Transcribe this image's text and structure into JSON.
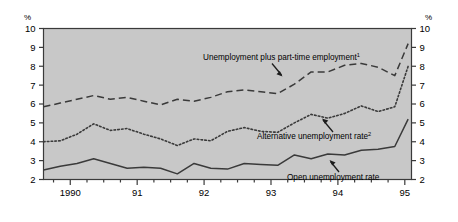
{
  "axis": {
    "unit_left": "%",
    "unit_right": "%",
    "y_ticks": [
      "10",
      "9",
      "8",
      "7",
      "6",
      "5",
      "4",
      "3",
      "2"
    ],
    "y_ticks_right": [
      "10",
      "9",
      "8",
      "7",
      "6",
      "5",
      "4",
      "3",
      "2"
    ],
    "x_labels": [
      "1990",
      "91",
      "92",
      "93",
      "94",
      "95"
    ]
  },
  "annotations": {
    "series1_label": "Unemployment plus part-time employment",
    "series1_sup": "1",
    "series2_label": "Alternative unemployment rate",
    "series2_sup": "2",
    "series3_label": "Open unemployment rate"
  },
  "colors": {
    "plot_background": "#c8c8c8",
    "plot_border": "#3a3a3a",
    "line": "#3a3a3a",
    "text": "#000000",
    "page_background": "#ffffff"
  },
  "chart_data": {
    "type": "line",
    "title": "",
    "subtitle": "",
    "xlabel": "",
    "ylabel": "%",
    "ylim": [
      2,
      10
    ],
    "xlim": [
      1989.6,
      1995.1
    ],
    "grid": false,
    "legend_position": "inline-annotations",
    "x_tick_labels": [
      "1990",
      "91",
      "92",
      "93",
      "94",
      "95"
    ],
    "x_tick_values": [
      1990,
      1991,
      1992,
      1993,
      1994,
      1995
    ],
    "x_minor_tick_interval": 0.25,
    "x": [
      1989.6,
      1989.85,
      1990.1,
      1990.35,
      1990.6,
      1990.85,
      1991.1,
      1991.35,
      1991.6,
      1991.85,
      1992.1,
      1992.35,
      1992.6,
      1992.85,
      1993.1,
      1993.35,
      1993.6,
      1993.85,
      1994.1,
      1994.35,
      1994.6,
      1994.85,
      1995.05
    ],
    "series": [
      {
        "name": "Unemployment plus part-time employment",
        "footnote": "1",
        "style": "dashed",
        "values": [
          5.85,
          6.05,
          6.25,
          6.45,
          6.25,
          6.35,
          6.15,
          5.95,
          6.25,
          6.15,
          6.35,
          6.65,
          6.75,
          6.65,
          6.55,
          7.05,
          7.7,
          7.7,
          8.05,
          8.15,
          7.95,
          7.5,
          9.2
        ]
      },
      {
        "name": "Alternative unemployment rate",
        "footnote": "2",
        "style": "dotted",
        "values": [
          4.0,
          4.05,
          4.4,
          4.95,
          4.6,
          4.7,
          4.4,
          4.15,
          3.8,
          4.15,
          4.05,
          4.55,
          4.75,
          4.55,
          4.5,
          5.0,
          5.45,
          5.25,
          5.5,
          5.9,
          5.6,
          5.85,
          8.0
        ]
      },
      {
        "name": "Open unemployment rate",
        "footnote": "",
        "style": "solid",
        "values": [
          2.5,
          2.7,
          2.85,
          3.1,
          2.85,
          2.6,
          2.65,
          2.6,
          2.3,
          2.85,
          2.6,
          2.55,
          2.85,
          2.8,
          2.75,
          3.3,
          3.1,
          3.35,
          3.3,
          3.55,
          3.6,
          3.75,
          5.2
        ]
      }
    ]
  }
}
